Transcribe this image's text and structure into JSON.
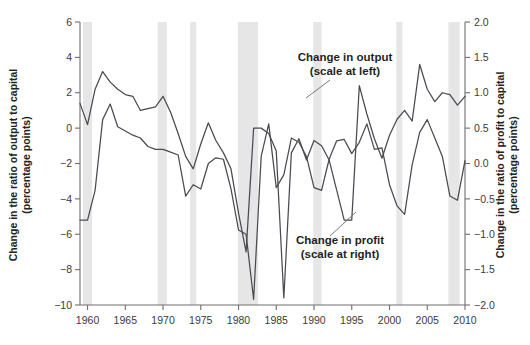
{
  "chart_data": {
    "type": "line",
    "title": "",
    "xlabel": "",
    "x_tick_labels": [
      "1960",
      "1965",
      "1970",
      "1975",
      "1980",
      "1985",
      "1990",
      "1995",
      "2000",
      "2005",
      "2010"
    ],
    "x_ticks": [
      1960,
      1965,
      1970,
      1975,
      1980,
      1985,
      1990,
      1995,
      2000,
      2005,
      2010
    ],
    "xlim": [
      1959,
      2010
    ],
    "grid": false,
    "legend_position": "inline-annotations",
    "left_axis": {
      "label": "Change in the ratio of output to capital\n(percentage points)",
      "label_line1": "Change in the ratio of output to capital",
      "label_line2": "(percentage points)",
      "ylim": [
        -10,
        6
      ],
      "ticks": [
        6,
        4,
        2,
        0,
        -2,
        -4,
        -6,
        -8,
        -10
      ],
      "tick_labels": [
        "6",
        "4",
        "2",
        "0",
        "−2",
        "−4",
        "−6",
        "−8",
        "−10"
      ]
    },
    "right_axis": {
      "label": "Change in the ratio of profit to capital\n(percentage points)",
      "label_line1": "Change in the ratio of profit to capital",
      "label_line2": "(percentage points)",
      "ylim": [
        -2.0,
        2.0
      ],
      "ticks": [
        2.0,
        1.5,
        1.0,
        0.5,
        0.0,
        -0.5,
        -1.0,
        -1.5,
        -2.0
      ],
      "tick_labels": [
        "2.0",
        "1.5",
        "1.0",
        "0.5",
        "0.0",
        "−0.5",
        "−1.0",
        "−1.5",
        "−2.0"
      ]
    },
    "series": [
      {
        "name": "Change in output",
        "axis": "left",
        "annotation_line1": "Change in output",
        "annotation_line2": "(scale at left)",
        "color": "#4a4a52",
        "x": [
          1959,
          1960,
          1961,
          1962,
          1963,
          1964,
          1965,
          1966,
          1967,
          1968,
          1969,
          1970,
          1971,
          1972,
          1973,
          1974,
          1975,
          1976,
          1977,
          1978,
          1979,
          1980,
          1981,
          1982,
          1983,
          1984,
          1985,
          1986,
          1987,
          1988,
          1989,
          1990,
          1991,
          1992,
          1993,
          1994,
          1995,
          1996,
          1997,
          1998,
          1999,
          2000,
          2001,
          2002,
          2003,
          2004,
          2005,
          2006,
          2007,
          2008,
          2009,
          2010
        ],
        "values": [
          1.4,
          0.2,
          2.2,
          3.2,
          2.6,
          2.2,
          1.9,
          1.8,
          1.0,
          1.1,
          1.2,
          1.8,
          0.9,
          -0.3,
          -1.6,
          -2.3,
          -0.9,
          0.3,
          -0.7,
          -1.4,
          -2.3,
          -4.8,
          -7.0,
          0.0,
          0.0,
          -0.3,
          -1.3,
          -9.6,
          -1.4,
          -0.6,
          -1.8,
          -0.7,
          -1.0,
          -1.8,
          -3.5,
          -5.2,
          -5.2,
          2.4,
          0.8,
          -0.6,
          -1.7,
          -0.4,
          0.5,
          1.0,
          0.4,
          3.6,
          2.2,
          1.5,
          2.0,
          1.9,
          1.3,
          1.8
        ]
      },
      {
        "name": "Change in profit",
        "axis": "right",
        "annotation_line1": "Change in profit",
        "annotation_line2": "(scale at right)",
        "color": "#4a4a52",
        "x": [
          1959,
          1960,
          1961,
          1962,
          1963,
          1964,
          1965,
          1966,
          1967,
          1968,
          1969,
          1970,
          1971,
          1972,
          1973,
          1974,
          1975,
          1976,
          1977,
          1978,
          1979,
          1980,
          1981,
          1982,
          1983,
          1984,
          1985,
          1986,
          1987,
          1988,
          1989,
          1990,
          1991,
          1992,
          1993,
          1994,
          1995,
          1996,
          1997,
          1998,
          1999,
          2000,
          2001,
          2002,
          2003,
          2004,
          2005,
          2006,
          2007,
          2008,
          2009,
          2010
        ],
        "values": [
          -0.8,
          -0.8,
          -0.38,
          0.62,
          0.84,
          0.52,
          0.46,
          0.4,
          0.36,
          0.24,
          0.2,
          0.2,
          0.16,
          0.12,
          -0.46,
          -0.3,
          -0.36,
          0.0,
          0.08,
          0.06,
          -0.36,
          -0.94,
          -1.0,
          -1.92,
          0.1,
          0.56,
          -0.34,
          -0.16,
          0.36,
          0.3,
          0.1,
          -0.34,
          -0.38,
          0.06,
          0.32,
          0.34,
          0.14,
          0.3,
          0.56,
          0.2,
          0.22,
          -0.3,
          -0.6,
          -0.72,
          -0.02,
          0.44,
          0.62,
          0.36,
          0.1,
          -0.46,
          -0.52,
          0.04
        ]
      }
    ],
    "recession_bands": [
      {
        "start": 1959.4,
        "end": 1960.6
      },
      {
        "start": 1969.3,
        "end": 1970.5
      },
      {
        "start": 1973.6,
        "end": 1974.4
      },
      {
        "start": 1979.9,
        "end": 1982.6
      },
      {
        "start": 1989.9,
        "end": 1991.0
      },
      {
        "start": 2000.9,
        "end": 2001.7
      },
      {
        "start": 2007.8,
        "end": 2009.3
      }
    ]
  }
}
